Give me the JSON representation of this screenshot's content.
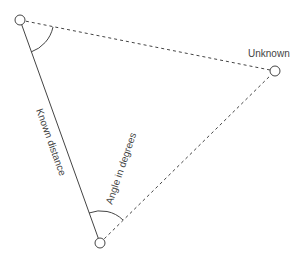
{
  "diagram": {
    "points": {
      "a": {
        "x": 20,
        "y": 20
      },
      "b": {
        "x": 275,
        "y": 71
      },
      "c": {
        "x": 100,
        "y": 243
      }
    },
    "labels": {
      "unknown": "Unknown",
      "known_distance": "Known distance",
      "angle": "Angle in degrees"
    },
    "colors": {
      "stroke": "#444444",
      "text": "#444444",
      "background": "#ffffff"
    }
  }
}
